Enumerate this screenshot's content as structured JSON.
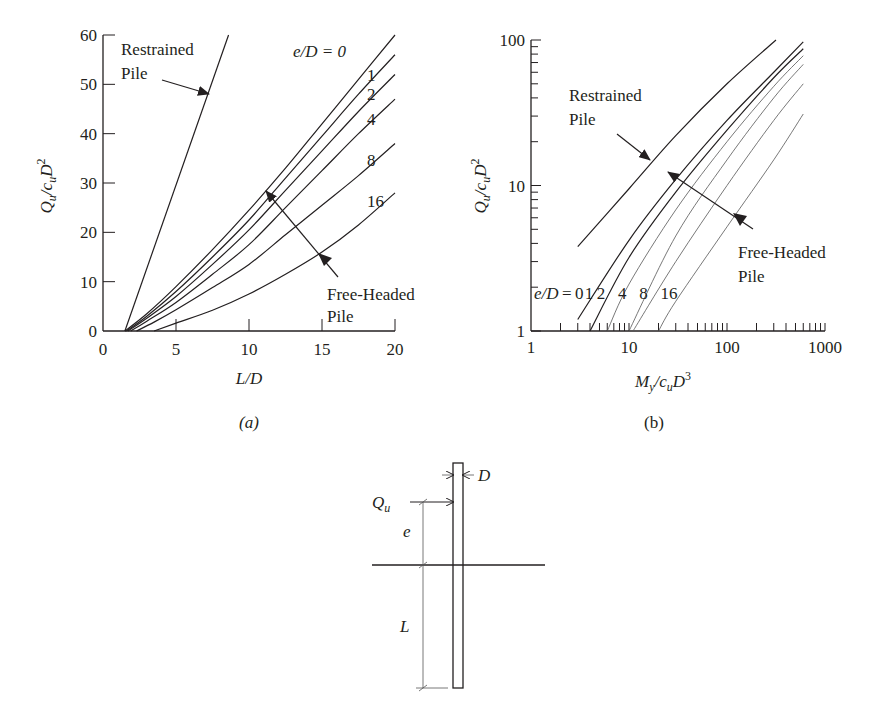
{
  "chart_data": [
    {
      "id": "a",
      "type": "line",
      "caption": "(a)",
      "title": "",
      "xlabel": "L/D",
      "ylabel": "Q_u/c_u D^2",
      "xlim": [
        0,
        20
      ],
      "ylim": [
        0,
        60
      ],
      "xticks": [
        0,
        5,
        10,
        15,
        20
      ],
      "yticks": [
        0,
        10,
        20,
        30,
        40,
        50,
        60
      ],
      "grid": false,
      "legend_header": "e/D = 0",
      "annotations": [
        {
          "text": "Restrained Pile",
          "lines": [
            "Restrained",
            "Pile"
          ]
        },
        {
          "text": "Free-Headed Pile",
          "lines": [
            "Free-Headed",
            "Pile"
          ]
        }
      ],
      "series": [
        {
          "name": "Restrained Pile",
          "x": [
            1.5,
            8.6
          ],
          "y": [
            0,
            60
          ]
        },
        {
          "name": "e/D = 0",
          "label": "0",
          "x": [
            1.5,
            3,
            5,
            7.5,
            10,
            12.5,
            15,
            17.5,
            20
          ],
          "y": [
            0,
            3.5,
            9,
            16.5,
            24.5,
            33,
            42,
            51,
            60
          ]
        },
        {
          "name": "e/D = 1",
          "label": "1",
          "x": [
            1.6,
            3,
            5,
            7.5,
            10,
            12.5,
            15,
            17.5,
            20
          ],
          "y": [
            0,
            3,
            8,
            15,
            22.5,
            31,
            39.5,
            48,
            56
          ]
        },
        {
          "name": "e/D = 2",
          "label": "2",
          "x": [
            1.7,
            3,
            5,
            7.5,
            10,
            12.5,
            15,
            17.5,
            20
          ],
          "y": [
            0,
            2.6,
            7,
            13.5,
            20.5,
            28.5,
            36.5,
            44.5,
            52
          ]
        },
        {
          "name": "e/D = 4",
          "label": "4",
          "x": [
            1.9,
            3,
            5,
            7.5,
            10,
            12.5,
            15,
            17.5,
            20
          ],
          "y": [
            0,
            2,
            5.8,
            11.5,
            17.5,
            25,
            32.5,
            40,
            47
          ]
        },
        {
          "name": "e/D = 8",
          "label": "8",
          "x": [
            2.3,
            3.5,
            5,
            7.5,
            10,
            12.5,
            15,
            17.5,
            20
          ],
          "y": [
            0,
            1.8,
            4.3,
            8.8,
            13.5,
            19.5,
            25.5,
            31.5,
            38
          ]
        },
        {
          "name": "e/D = 16",
          "label": "16",
          "x": [
            3.5,
            5,
            7.5,
            10,
            12.5,
            15,
            17.5,
            20
          ],
          "y": [
            0,
            1.6,
            4.2,
            7.5,
            11.5,
            16,
            21.5,
            28
          ]
        }
      ]
    },
    {
      "id": "b",
      "type": "line",
      "caption": "(b)",
      "title": "",
      "xlabel": "M_y/c_u D^3",
      "ylabel": "Q_u/c_u D^2",
      "xscale": "log",
      "yscale": "log",
      "xlim": [
        1,
        1000
      ],
      "ylim": [
        1,
        100
      ],
      "xticks": [
        1,
        10,
        100,
        1000
      ],
      "yticks": [
        1,
        10,
        100
      ],
      "grid": false,
      "legend_header": "e/D = 0 1 2 4 8 16",
      "annotations": [
        {
          "text": "Restrained Pile",
          "lines": [
            "Restrained",
            "Pile"
          ]
        },
        {
          "text": "Free-Headed Pile",
          "lines": [
            "Free-Headed",
            "Pile"
          ]
        }
      ],
      "series": [
        {
          "name": "Restrained Pile",
          "x": [
            3,
            10,
            30,
            100,
            316
          ],
          "y": [
            3.8,
            9.5,
            22,
            50,
            100
          ]
        },
        {
          "name": "e/D = 0",
          "label": "0",
          "x": [
            3,
            10,
            30,
            100,
            300,
            600
          ],
          "y": [
            1.2,
            4.2,
            11,
            28,
            60,
            97
          ]
        },
        {
          "name": "e/D = 1",
          "label": "1",
          "x": [
            4,
            10,
            30,
            100,
            300,
            600
          ],
          "y": [
            1,
            3.2,
            9,
            24,
            55,
            87
          ]
        },
        {
          "name": "e/D = 2",
          "label": "2",
          "x": [
            6,
            10,
            30,
            100,
            300,
            600
          ],
          "y": [
            1,
            2.1,
            6.8,
            20,
            48,
            78
          ]
        },
        {
          "name": "e/D = 4",
          "label": "4",
          "x": [
            10,
            30,
            100,
            300,
            600
          ],
          "y": [
            1,
            4.5,
            15,
            40,
            68
          ]
        },
        {
          "name": "e/D = 8",
          "label": "8",
          "x": [
            11,
            30,
            100,
            300,
            600
          ],
          "y": [
            1,
            3,
            10,
            28,
            50
          ]
        },
        {
          "name": "e/D = 16",
          "label": "16",
          "x": [
            20,
            30,
            100,
            300,
            600
          ],
          "y": [
            1,
            1.6,
            5.2,
            15,
            31
          ]
        }
      ]
    }
  ],
  "figure": {
    "caption_a": "(a)",
    "caption_b": "(b)",
    "chart_a": {
      "xlabel_main": "L/D",
      "ylabel_q": "Q",
      "ylabel_u": "u",
      "ylabel_c": "/c",
      "ylabel_u2": "u",
      "ylabel_d": "D",
      "ylabel_sup": "2",
      "legend_header": "e/D = 0",
      "restrained_1": "Restrained",
      "restrained_2": "Pile",
      "free_1": "Free-Headed",
      "free_2": "Pile",
      "curve_labels": [
        "1",
        "2",
        "4",
        "8",
        "16"
      ]
    },
    "chart_b": {
      "xlabel_m": "M",
      "xlabel_y": "y",
      "xlabel_c": "/c",
      "xlabel_u": "u",
      "xlabel_d": "D",
      "xlabel_sup": "3",
      "legend": "e/D = 0 1 2  4   8   16",
      "restrained_1": "Restrained",
      "restrained_2": "Pile",
      "free_1": "Free-Headed",
      "free_2": "Pile"
    },
    "diagram": {
      "load_label": "Q",
      "load_sub": "u",
      "diameter_label": "D",
      "eccentricity_label": "e",
      "length_label": "L"
    }
  }
}
